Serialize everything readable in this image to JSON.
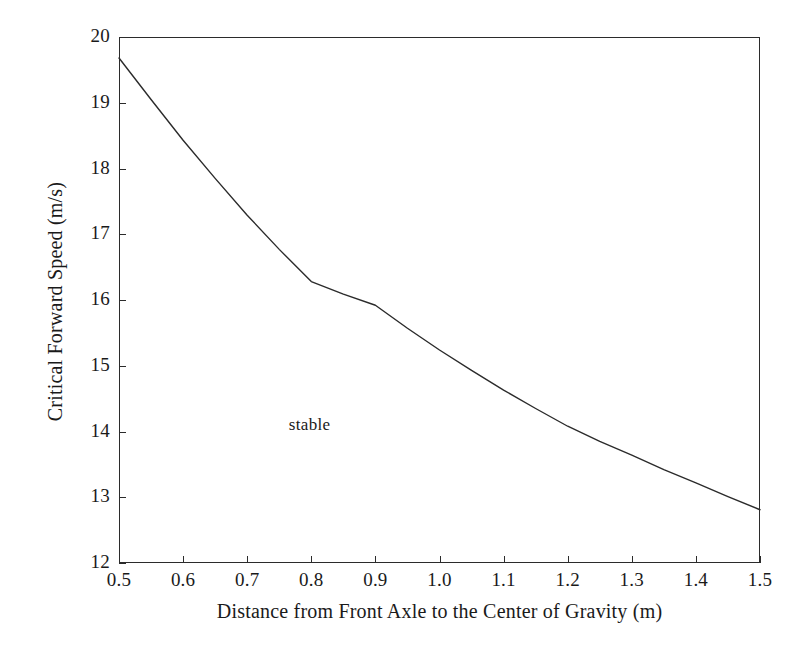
{
  "chart_data": {
    "type": "line",
    "title": "",
    "xlabel": "Distance from Front Axle to the Center of Gravity (m)",
    "ylabel": "Critical Forward Speed (m/s)",
    "xlim": [
      0.5,
      1.5
    ],
    "ylim": [
      12,
      20
    ],
    "grid": false,
    "legend": null,
    "xticks": [
      0.5,
      0.6,
      0.7,
      0.8,
      0.9,
      1.0,
      1.1,
      1.2,
      1.3,
      1.4,
      1.5
    ],
    "xticklabels": [
      "0.5",
      "0.6",
      "0.7",
      "0.8",
      "0.9",
      "1.0",
      "1.1",
      "1.2",
      "1.3",
      "1.4",
      "1.5"
    ],
    "yticks": [
      12,
      13,
      14,
      15,
      16,
      17,
      18,
      19,
      20
    ],
    "yticklabels": [
      "12",
      "13",
      "14",
      "15",
      "16",
      "17",
      "18",
      "19",
      "20"
    ],
    "series": [
      {
        "name": "critical forward speed",
        "color": "#2b2b2b",
        "x": [
          0.5,
          0.55,
          0.6,
          0.65,
          0.7,
          0.75,
          0.8,
          0.85,
          0.9,
          0.95,
          1.0,
          1.05,
          1.1,
          1.15,
          1.2,
          1.25,
          1.3,
          1.35,
          1.4,
          1.45,
          1.5
        ],
        "values": [
          19.68,
          19.05,
          18.43,
          17.85,
          17.29,
          16.77,
          16.28,
          16.09,
          15.92,
          15.57,
          15.24,
          14.93,
          14.63,
          14.35,
          14.08,
          13.85,
          13.64,
          13.42,
          13.22,
          13.01,
          12.81
        ]
      }
    ],
    "annotations": [
      {
        "text": "stable",
        "x": 0.765,
        "y": 14.08
      }
    ]
  },
  "axis": {
    "x_title": "Distance from Front Axle to the Center of Gravity (m)",
    "y_title": "Critical Forward Speed (m/s)"
  }
}
